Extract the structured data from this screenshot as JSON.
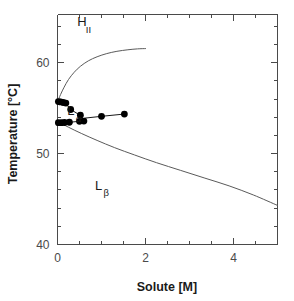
{
  "chart_data": {
    "type": "scatter",
    "title": "",
    "xlabel": "Solute  [M]",
    "ylabel": "Temperature [°C]",
    "xlim": [
      0,
      5
    ],
    "ylim": [
      40,
      65.3
    ],
    "grid": false,
    "legend_position": "none",
    "x_ticks_major": [
      0,
      2,
      4
    ],
    "x_tick_labels": [
      "0",
      "2",
      "4"
    ],
    "x_ticks_minor": [
      0.5,
      1,
      1.5,
      2.5,
      3,
      3.5,
      4.5,
      5
    ],
    "y_ticks_major": [
      40,
      50,
      60
    ],
    "y_tick_labels": [
      "40",
      "50",
      "60"
    ],
    "y_ticks_minor": [
      42,
      44,
      46,
      48,
      52,
      54,
      56,
      58,
      62,
      64
    ],
    "annotations": [
      {
        "name": "H_II",
        "base": "H",
        "sub": "II",
        "x": 0.45,
        "y": 64.0
      },
      {
        "name": "L_alpha",
        "base": "L",
        "sub": "α",
        "x": 0.22,
        "y": 54.2
      },
      {
        "name": "L_beta",
        "base": "L",
        "sub": "β",
        "x": 0.85,
        "y": 46.0
      }
    ],
    "series": [
      {
        "name": "H_II phase boundary",
        "type": "line",
        "style": "solid",
        "points": [
          [
            0.0,
            55.7
          ],
          [
            0.07,
            56.5
          ],
          [
            0.15,
            57.3
          ],
          [
            0.25,
            58.15
          ],
          [
            0.38,
            58.95
          ],
          [
            0.52,
            59.6
          ],
          [
            0.7,
            60.2
          ],
          [
            0.9,
            60.65
          ],
          [
            1.12,
            61.0
          ],
          [
            1.35,
            61.25
          ],
          [
            1.6,
            61.42
          ],
          [
            1.82,
            61.52
          ],
          [
            2.0,
            61.55
          ]
        ]
      },
      {
        "name": "L_beta phase boundary",
        "type": "line",
        "style": "solid",
        "points": [
          [
            0.0,
            53.55
          ],
          [
            0.25,
            52.9
          ],
          [
            0.55,
            52.2
          ],
          [
            0.9,
            51.45
          ],
          [
            1.3,
            50.65
          ],
          [
            1.75,
            49.85
          ],
          [
            2.25,
            49.0
          ],
          [
            2.8,
            48.15
          ],
          [
            3.35,
            47.3
          ],
          [
            3.9,
            46.45
          ],
          [
            4.45,
            45.45
          ],
          [
            5.0,
            44.3
          ]
        ]
      },
      {
        "name": "upper transition data",
        "type": "scatter-line",
        "marker": "filled-circle",
        "points": [
          [
            0.02,
            55.7
          ],
          [
            0.07,
            55.65
          ],
          [
            0.12,
            55.6
          ],
          [
            0.18,
            55.55
          ],
          [
            0.3,
            54.85
          ],
          [
            0.52,
            54.2
          ],
          [
            0.6,
            53.55
          ]
        ]
      },
      {
        "name": "lower transition data",
        "type": "scatter-line",
        "marker": "filled-circle",
        "points": [
          [
            0.02,
            53.4
          ],
          [
            0.1,
            53.4
          ],
          [
            0.18,
            53.45
          ],
          [
            0.28,
            53.45
          ],
          [
            0.5,
            53.55
          ],
          [
            0.62,
            53.9
          ],
          [
            1.0,
            54.1
          ],
          [
            1.52,
            54.35
          ]
        ]
      }
    ],
    "marker_points": [
      [
        0.02,
        55.72
      ],
      [
        0.07,
        55.68
      ],
      [
        0.13,
        55.62
      ],
      [
        0.19,
        55.56
      ],
      [
        0.3,
        54.85
      ],
      [
        0.52,
        54.22
      ],
      [
        0.6,
        53.58
      ],
      [
        0.02,
        53.4
      ],
      [
        0.09,
        53.4
      ],
      [
        0.16,
        53.42
      ],
      [
        0.27,
        53.45
      ],
      [
        0.5,
        53.55
      ],
      [
        1.0,
        54.1
      ],
      [
        1.52,
        54.35
      ]
    ]
  },
  "axes": {
    "x_title": "Solute  [M]",
    "y_title": "Temperature [°C]"
  }
}
